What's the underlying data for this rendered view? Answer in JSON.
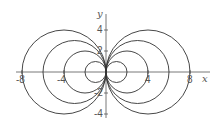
{
  "chart_data": {
    "type": "line",
    "title": "",
    "series": [
      {
        "name": "c=1",
        "center": [
          1,
          0
        ],
        "radius": 1
      },
      {
        "name": "c=2",
        "center": [
          2,
          0
        ],
        "radius": 2
      },
      {
        "name": "c=3",
        "center": [
          3,
          0
        ],
        "radius": 3
      },
      {
        "name": "c=4",
        "center": [
          4,
          0
        ],
        "radius": 4
      },
      {
        "name": "c=-1",
        "center": [
          -1,
          0
        ],
        "radius": 1
      },
      {
        "name": "c=-2",
        "center": [
          -2,
          0
        ],
        "radius": 2
      },
      {
        "name": "c=-3",
        "center": [
          -3,
          0
        ],
        "radius": 3
      },
      {
        "name": "c=-4",
        "center": [
          -4,
          0
        ],
        "radius": 4
      }
    ],
    "xlabel": "x",
    "ylabel": "y",
    "xticks": [
      -8,
      -4,
      4,
      8
    ],
    "yticks": [
      4,
      2,
      -2,
      -4
    ],
    "xlim": [
      -8.5,
      9.5
    ],
    "ylim": [
      -4.5,
      5.5
    ],
    "grid": false,
    "legend": "none"
  },
  "axes": {
    "x_label": "x",
    "y_label": "y",
    "x_tick_labels": [
      "-8",
      "-4",
      "4",
      "8"
    ],
    "y_tick_labels": [
      "4",
      "2",
      "-2",
      "-4"
    ]
  },
  "colors": {
    "curve": "#333333",
    "axis": "#555555"
  }
}
